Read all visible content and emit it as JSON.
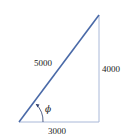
{
  "diagram": {
    "type": "right-triangle",
    "hypotenuse_label": "5000",
    "vertical_leg_label": "4000",
    "horizontal_leg_label": "3000",
    "angle_label": "ϕ",
    "colors": {
      "hypotenuse": "#4a6aa8",
      "legs": "#a9b8d8",
      "angle_arc": "#2a3a6a",
      "text": "#222222"
    }
  }
}
